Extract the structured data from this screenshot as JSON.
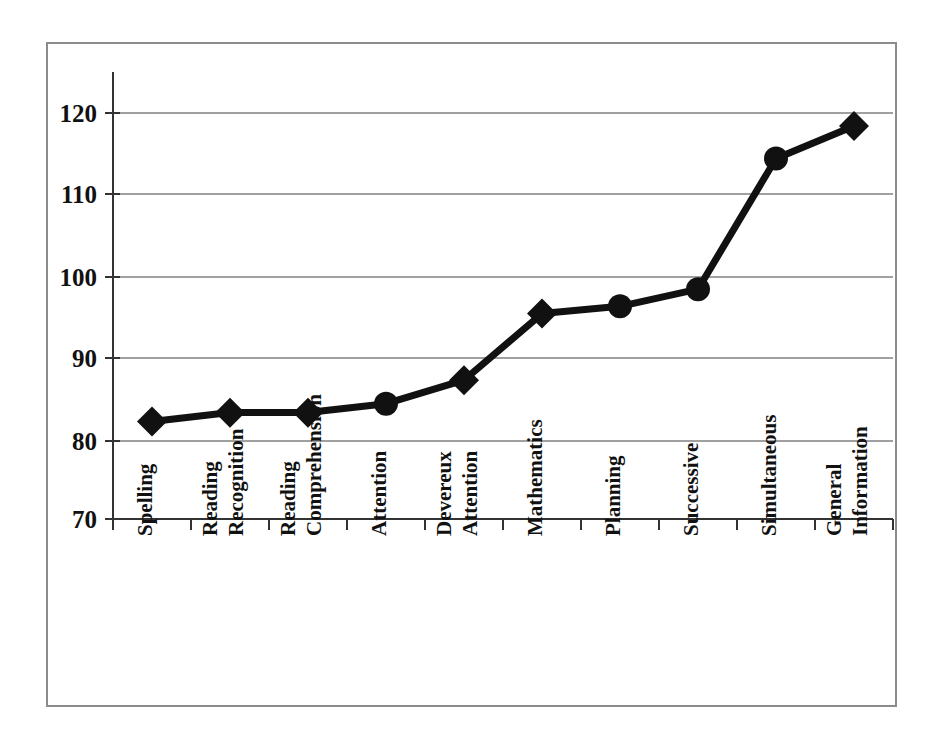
{
  "chart_data": {
    "type": "line",
    "title": "",
    "subtitle": "",
    "xlabel": "",
    "ylabel": "",
    "categories": [
      "Spelling",
      "Reading Recognition",
      "Reading Comprehension",
      "Attention",
      "Devereux Attention",
      "Mathematics",
      "Planning",
      "Successive",
      "Simultaneous",
      "General Information"
    ],
    "category_lines": [
      [
        "Spelling"
      ],
      [
        "Reading",
        "Recognition"
      ],
      [
        "Reading",
        "Comprehension"
      ],
      [
        "Attention"
      ],
      [
        "Devereux",
        "Attention"
      ],
      [
        "Mathematics"
      ],
      [
        "Planning"
      ],
      [
        "Successive"
      ],
      [
        "Simultaneous"
      ],
      [
        "General",
        "Information"
      ]
    ],
    "values": [
      82.0,
      83.1,
      83.1,
      84.2,
      87.1,
      95.3,
      96.2,
      98.3,
      114.4,
      118.4
    ],
    "marker_shapes": [
      "diamond",
      "diamond",
      "diamond",
      "circle",
      "diamond",
      "diamond",
      "circle",
      "circle",
      "circle",
      "diamond"
    ],
    "ylim": [
      70,
      125
    ],
    "yticks": [
      70,
      80,
      90,
      100,
      110,
      120
    ],
    "ytick_labels": [
      "70",
      "80",
      "90",
      "100",
      "110",
      "120"
    ],
    "grid": true,
    "legend": false,
    "legend_position": "none",
    "series_color": "#111111",
    "grid_color": "#808080",
    "axis_color": "#444444",
    "frame_color": "#8c8c8c",
    "background": "#ffffff",
    "label_rotation_deg": -90
  }
}
